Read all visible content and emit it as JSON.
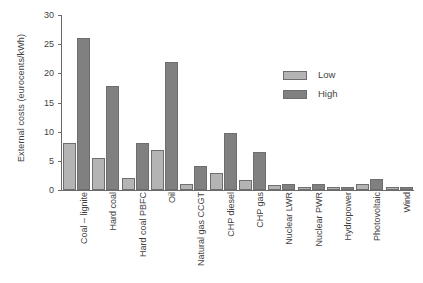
{
  "chart_data": {
    "type": "bar",
    "title": "",
    "xlabel": "",
    "ylabel": "External costs (eurocents/kWh)",
    "ylim": [
      0,
      30
    ],
    "yticks": [
      0,
      5,
      10,
      15,
      20,
      25,
      30
    ],
    "grid": false,
    "legend_position": "upper-right-inside",
    "categories": [
      "Coal – lignite",
      "Hard coal",
      "Hard coal PBFC",
      "Oil",
      "Natural gas CCGT",
      "CHP diesel",
      "CHP gas",
      "Nuclear LWR",
      "Nuclear PWR",
      "Hydropower",
      "Photovoltaic",
      "Wind"
    ],
    "series": [
      {
        "name": "Low",
        "color": "#b4b4b4",
        "values": [
          8.0,
          5.5,
          2.1,
          6.8,
          1.1,
          2.9,
          1.7,
          0.8,
          0.6,
          0.45,
          1.0,
          0.45
        ]
      },
      {
        "name": "High",
        "color": "#808080",
        "values": [
          26.0,
          17.8,
          8.1,
          22.0,
          4.1,
          9.7,
          6.5,
          0.95,
          1.0,
          0.6,
          1.9,
          0.6
        ]
      }
    ]
  },
  "legend": {
    "items": [
      {
        "label": "Low"
      },
      {
        "label": "High"
      }
    ]
  },
  "colors": {
    "low": "#b4b4b4",
    "high": "#808080",
    "axis": "#6a6a6a",
    "text": "#3f3f3f",
    "background": "#ffffff"
  }
}
